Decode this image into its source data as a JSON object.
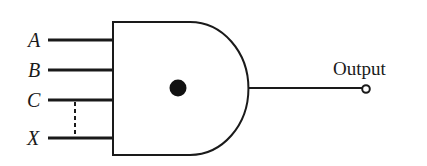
{
  "diagram": {
    "type": "logic-gate",
    "gate_kind": "AND",
    "gate_center_marker": "filled-dot",
    "inputs": [
      {
        "label": "A",
        "y": 40
      },
      {
        "label": "B",
        "y": 70
      },
      {
        "label": "C",
        "y": 100
      },
      {
        "label": "X",
        "y": 138
      }
    ],
    "ellipsis_between": [
      "C",
      "X"
    ],
    "output": {
      "label": "Output",
      "terminal": "open-circle"
    },
    "colors": {
      "stroke": "#1a1a1a",
      "background": "#ffffff"
    }
  }
}
